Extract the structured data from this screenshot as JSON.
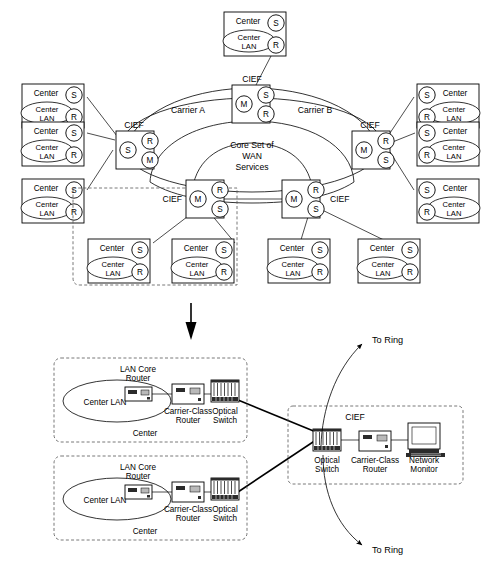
{
  "figure": {
    "upper_section": {
      "cloud": {
        "core_label_lines": [
          "Core Set of",
          "WAN",
          "Services"
        ],
        "carrier_a_label": "Carrier A",
        "carrier_b_label": "Carrier B"
      },
      "node_label": "CIEF",
      "node_role_letters": {
        "switch": "S",
        "router": "R",
        "monitor": "M"
      },
      "center_box": {
        "title": "Center",
        "lan_line1": "Center",
        "lan_line2": "LAN",
        "port_top": "S",
        "port_bottom": "R"
      },
      "cief_nodes": [
        {
          "name": "cief-top",
          "label": "CIEF",
          "inner": "M",
          "edge_top": "S",
          "edge_bottom": "R",
          "label_side": "top"
        },
        {
          "name": "cief-left",
          "label": "CIEF",
          "inner": "S",
          "edge_top": "R",
          "edge_bottom": "M",
          "label_side": "top"
        },
        {
          "name": "cief-right",
          "label": "CIEF",
          "inner": "M",
          "edge_top": "R",
          "edge_bottom": "S",
          "label_side": "top"
        },
        {
          "name": "cief-bottom-left",
          "label": "CIEF",
          "inner": "M",
          "edge_top": "R",
          "edge_bottom": "S",
          "label_side": "left"
        },
        {
          "name": "cief-bottom-right",
          "label": "CIEF",
          "inner": "M",
          "edge_top": "R",
          "edge_bottom": "S",
          "label_side": "right"
        }
      ],
      "centers": [
        {
          "name": "center-left-1",
          "side": "left"
        },
        {
          "name": "center-left-2",
          "side": "left"
        },
        {
          "name": "center-left-3",
          "side": "left"
        },
        {
          "name": "center-right-1",
          "side": "right"
        },
        {
          "name": "center-right-2",
          "side": "right"
        },
        {
          "name": "center-right-3",
          "side": "right"
        },
        {
          "name": "center-top",
          "side": "top"
        },
        {
          "name": "center-bottom-1",
          "side": "bottom"
        },
        {
          "name": "center-bottom-2",
          "side": "bottom"
        },
        {
          "name": "center-bottom-3",
          "side": "bottom"
        },
        {
          "name": "center-bottom-4",
          "side": "bottom"
        }
      ]
    },
    "lower_section": {
      "center_groups": [
        {
          "name": "center-detail-1",
          "group_label": "Center",
          "lan_label": "Center LAN",
          "lan_core_router_line1": "LAN Core",
          "lan_core_router_line2": "Router",
          "carrier_router_line1": "Carrier-Class",
          "carrier_router_line2": "Router",
          "optical_switch_line1": "Optical",
          "optical_switch_line2": "Switch"
        },
        {
          "name": "center-detail-2",
          "group_label": "Center",
          "lan_label": "Center LAN",
          "lan_core_router_line1": "LAN Core",
          "lan_core_router_line2": "Router",
          "carrier_router_line1": "Carrier-Class",
          "carrier_router_line2": "Router",
          "optical_switch_line1": "Optical",
          "optical_switch_line2": "Switch"
        }
      ],
      "cief_block": {
        "label": "CIEF",
        "optical_switch_line1": "Optical",
        "optical_switch_line2": "Switch",
        "carrier_router_line1": "Carrier-Class",
        "carrier_router_line2": "Router",
        "network_monitor_line1": "Network",
        "network_monitor_line2": "Monitor"
      },
      "ring_arrows": [
        {
          "name": "to-ring-top",
          "label": "To Ring"
        },
        {
          "name": "to-ring-bottom",
          "label": "To Ring"
        }
      ]
    },
    "colors": {
      "stroke": "#000000",
      "dashed_stroke": "#555555",
      "background": "#ffffff",
      "icon_fill": "#b9b9b9"
    }
  }
}
